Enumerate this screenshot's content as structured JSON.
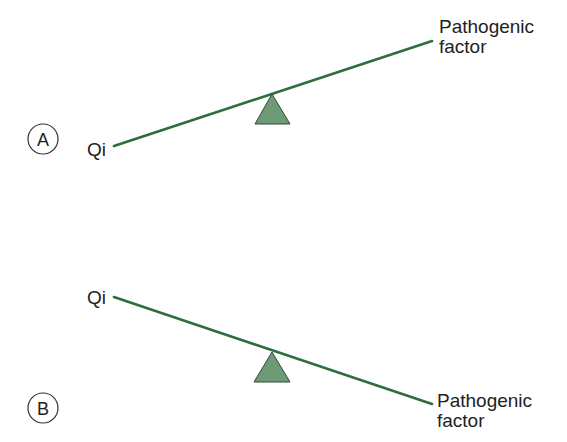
{
  "colors": {
    "beam": "#2e6e3a",
    "fulcrum_fill": "#6f9a78",
    "fulcrum_stroke": "#2f4a34",
    "text": "#222222",
    "circle_stroke": "#333333"
  },
  "panels": [
    {
      "id": "A",
      "marker": "A",
      "left_label": "Qi",
      "right_label_line1": "Pathogenic",
      "right_label_line2": "factor",
      "description": "Qi side low, pathogenic factor side high"
    },
    {
      "id": "B",
      "marker": "B",
      "left_label": "Qi",
      "right_label_line1": "Pathogenic",
      "right_label_line2": "factor",
      "description": "Qi side high, pathogenic factor side low"
    }
  ]
}
